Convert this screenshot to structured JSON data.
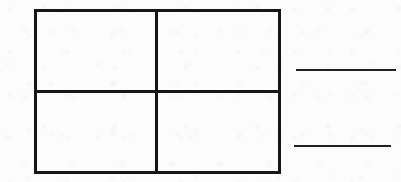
{
  "page": {
    "background_color": "#fcfcfc",
    "ink_color": "#161616",
    "rule_color": "#222222",
    "width": 401,
    "height": 182
  },
  "grid": {
    "name": "2x2 rectangle grid",
    "rows": 2,
    "columns": 2,
    "border_thickness_px": 3,
    "bounds": {
      "left": 34,
      "top": 9,
      "right": 281,
      "bottom": 174
    },
    "dividers": {
      "vertical_x": 155,
      "horizontal_y": 90
    },
    "cells": [
      {
        "id": "cell-top-left",
        "row": 0,
        "col": 0,
        "text": ""
      },
      {
        "id": "cell-top-right",
        "row": 0,
        "col": 1,
        "text": ""
      },
      {
        "id": "cell-bottom-left",
        "row": 1,
        "col": 0,
        "text": ""
      },
      {
        "id": "cell-bottom-right",
        "row": 1,
        "col": 1,
        "text": ""
      }
    ]
  },
  "answer_rules": [
    {
      "id": "answer-rule-upper",
      "label": "",
      "left": 296,
      "top": 69,
      "width": 100,
      "thickness_px": 2
    },
    {
      "id": "answer-rule-lower",
      "label": "",
      "left": 294,
      "top": 145,
      "width": 97,
      "thickness_px": 2
    }
  ]
}
